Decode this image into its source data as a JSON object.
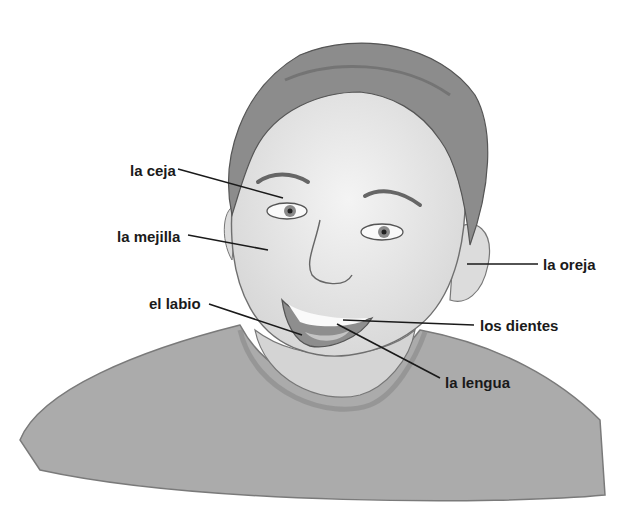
{
  "diagram": {
    "colors": {
      "skin": "#e9e9e9",
      "hair": "#8a8a8a",
      "shirt": "#a8a8a8",
      "line": "#1a1a1a"
    },
    "labels": [
      {
        "id": "ceja",
        "text": "la ceja",
        "x": 130,
        "y": 163,
        "target": [
          283,
          198
        ]
      },
      {
        "id": "mejilla",
        "text": "la mejilla",
        "x": 117,
        "y": 229,
        "target": [
          268,
          250
        ]
      },
      {
        "id": "oreja",
        "text": "la oreja",
        "x": 543,
        "y": 257,
        "target": [
          467,
          264
        ]
      },
      {
        "id": "labio",
        "text": "el labio",
        "x": 149,
        "y": 296,
        "target": [
          302,
          335
        ]
      },
      {
        "id": "dientes",
        "text": "los dientes",
        "x": 480,
        "y": 318,
        "target": [
          343,
          320
        ]
      },
      {
        "id": "lengua",
        "text": "la lengua",
        "x": 445,
        "y": 375,
        "target": [
          337,
          324
        ]
      }
    ]
  }
}
